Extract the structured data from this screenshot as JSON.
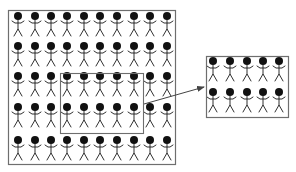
{
  "diagram": {
    "colors": {
      "background": "#ffffff",
      "border": "#6e6e6e",
      "figure": "#1a1a1a",
      "head": "#111111",
      "arrow": "#444444"
    },
    "population_box": {
      "x": 8,
      "y": 10,
      "width": 167,
      "height": 154,
      "rows": 5,
      "cols": 10,
      "head_x": [
        18,
        35,
        51,
        67,
        84,
        100,
        117,
        134,
        150,
        167
      ],
      "head_y": [
        16,
        46,
        76,
        107,
        140
      ]
    },
    "highlight_box": {
      "x": 60,
      "y": 73,
      "width": 83,
      "height": 60,
      "rows_covered": [
        3,
        4
      ],
      "cols_covered": [
        4,
        5,
        6,
        7,
        8
      ]
    },
    "sample_box": {
      "x": 206,
      "y": 56,
      "width": 82,
      "height": 61,
      "rows": 2,
      "cols": 5,
      "head_x": [
        213,
        230,
        247,
        263,
        279
      ],
      "head_y": [
        61,
        92
      ]
    },
    "arrow": {
      "x1": 144,
      "y1": 104,
      "x2": 204,
      "y2": 87
    },
    "figure": {
      "head_r": 4,
      "arm_half": 6,
      "body_len": 9,
      "leg_len": 7,
      "leg_spread": 4
    }
  }
}
